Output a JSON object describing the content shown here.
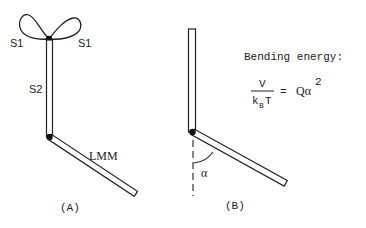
{
  "panel_a": {
    "caption": "(A)",
    "labels": {
      "s1_left": "S1",
      "s1_right": "S1",
      "s2": "S2",
      "lmm": "LMM"
    }
  },
  "panel_b": {
    "caption": "(B)",
    "angle_label": "α",
    "title": "Bending energy:",
    "formula": {
      "numerator": "V",
      "denominator_k": "k",
      "denominator_sub": "B",
      "denominator_t": "T",
      "equals": "=",
      "rhs": "Qα",
      "rhs_exponent": "2"
    }
  },
  "colors": {
    "ink": "#222222",
    "background": "#ffffff"
  }
}
